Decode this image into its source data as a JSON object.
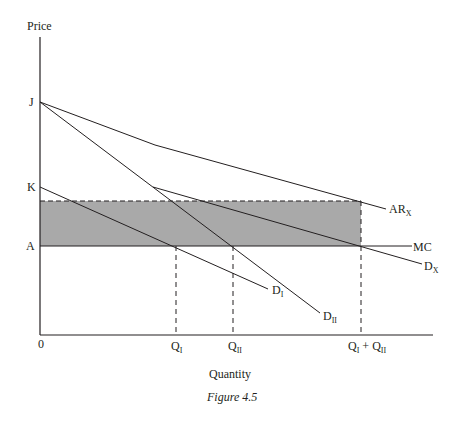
{
  "figure": {
    "caption": "Figure 4.5",
    "y_axis_title": "Price",
    "x_axis_title": "Quantity",
    "origin_label": "0"
  },
  "y_labels": {
    "J": "J",
    "K": "K",
    "A": "A"
  },
  "x_labels": {
    "QI": {
      "base": "Q",
      "sub": "I"
    },
    "QII": {
      "base": "Q",
      "sub": "II"
    },
    "QIplusQII": {
      "base1": "Q",
      "sub1": "I",
      "plus": " + ",
      "base2": "Q",
      "sub2": "II"
    }
  },
  "curves": {
    "ARx": {
      "base": "AR",
      "sub": "X"
    },
    "MC": {
      "base": "MC"
    },
    "Dx": {
      "base": "D",
      "sub": "X"
    },
    "DI": {
      "base": "D",
      "sub": "I"
    },
    "DII": {
      "base": "D",
      "sub": "II"
    }
  },
  "colors": {
    "ink": "#231f20",
    "shaded_region": "#a9a9a9"
  },
  "diagram_content": {
    "type": "economics price-discrimination diagram",
    "points": {
      "J": [
        40,
        102
      ],
      "K": [
        40,
        187
      ],
      "A": [
        40,
        246
      ],
      "origin": [
        40,
        335
      ]
    },
    "lines": {
      "ARx": [
        [
          40,
          102
        ],
        [
          155,
          145
        ],
        [
          386,
          209
        ]
      ],
      "Dx": [
        [
          153,
          187
        ],
        [
          422,
          264
        ]
      ],
      "DI": [
        [
          40,
          187
        ],
        [
          268,
          289
        ]
      ],
      "DII": [
        [
          40,
          102
        ],
        [
          320,
          313
        ]
      ],
      "MC": [
        [
          40,
          246
        ],
        [
          412,
          246
        ]
      ]
    },
    "shaded_rect": {
      "x1": 40,
      "y1": 201,
      "x2": 361,
      "y2": 246
    },
    "dashed_verticals": [
      176,
      233,
      361
    ]
  }
}
